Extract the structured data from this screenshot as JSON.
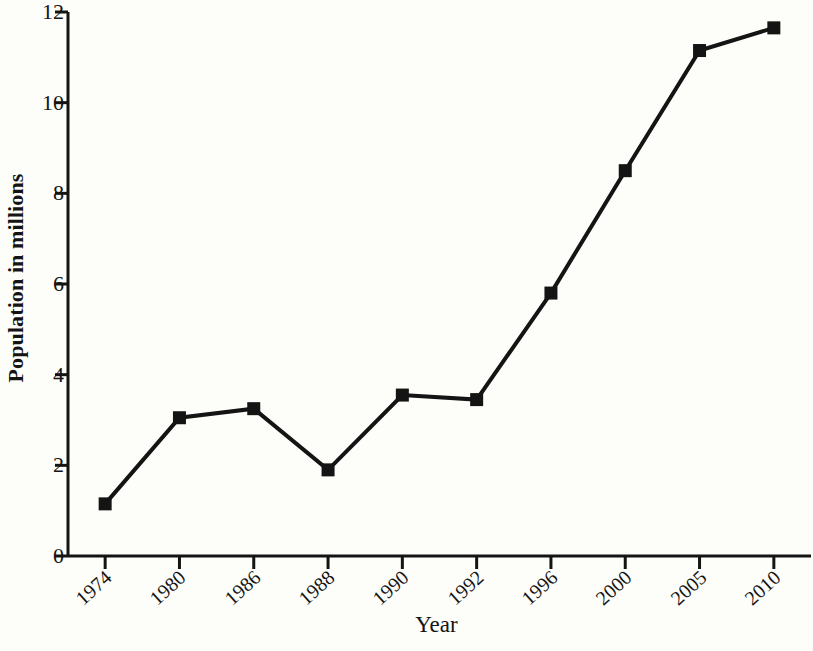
{
  "chart_data": {
    "type": "line",
    "title": "",
    "xlabel": "Year",
    "ylabel": "Population in millions",
    "categories": [
      "1974",
      "1980",
      "1986",
      "1988",
      "1990",
      "1992",
      "1996",
      "2000",
      "2005",
      "2010"
    ],
    "values": [
      1.15,
      3.05,
      3.25,
      1.9,
      3.55,
      3.45,
      5.8,
      8.5,
      11.15,
      11.65
    ],
    "series": [
      {
        "name": "Population",
        "values": [
          1.15,
          3.05,
          3.25,
          1.9,
          3.55,
          3.45,
          5.8,
          8.5,
          11.15,
          11.65
        ]
      }
    ],
    "ylim": [
      0,
      12
    ],
    "y_ticks": [
      "0",
      "2",
      "4",
      "6",
      "8",
      "10",
      "12"
    ],
    "y_tick_values": [
      0,
      2,
      4,
      6,
      8,
      10,
      12
    ],
    "grid": false,
    "legend": false,
    "marker": "square",
    "line_color": "#141414",
    "marker_color": "#141414",
    "background_color": "#fdfdf9",
    "axis_color": "#141414"
  }
}
